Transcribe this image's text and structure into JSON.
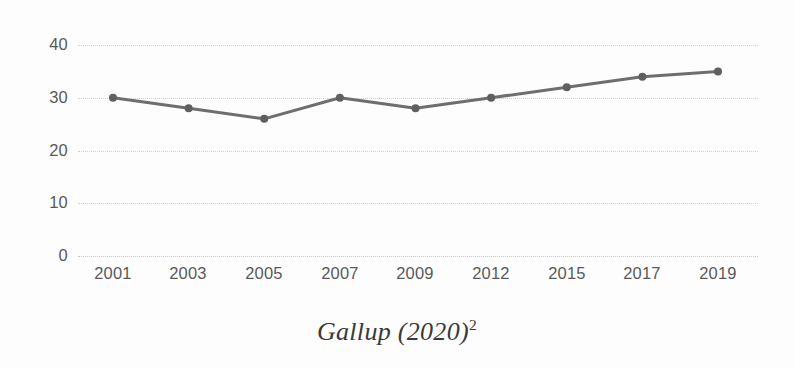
{
  "caption": {
    "text": "Gallup (2020)",
    "superscript": "2"
  },
  "colors": {
    "line": "#6e6e6e",
    "marker": "#5f5f5f",
    "grid": "#cfcfcf",
    "tick_text": "#5a5a5a",
    "background": "#fdfdfd",
    "caption_text": "#3a3a3a"
  },
  "chart_data": {
    "type": "line",
    "title": "",
    "subtitle": "",
    "xlabel": "",
    "ylabel": "",
    "categories": [
      "2001",
      "2003",
      "2005",
      "2007",
      "2009",
      "2012",
      "2015",
      "2017",
      "2019"
    ],
    "values": [
      30,
      28,
      26,
      30,
      28,
      30,
      32,
      34,
      35
    ],
    "series": [
      {
        "name": "Gallup",
        "values": [
          30,
          28,
          26,
          30,
          28,
          30,
          32,
          34,
          35
        ]
      }
    ],
    "ylim": [
      0,
      40
    ],
    "yticks": [
      0,
      10,
      20,
      30,
      40
    ],
    "ytick_labels": [
      "0",
      "10",
      "20",
      "30",
      "40"
    ],
    "xtick_labels": [
      "2001",
      "2003",
      "2005",
      "2007",
      "2009",
      "2012",
      "2015",
      "2017",
      "2019"
    ],
    "grid": "horizontal-dotted",
    "legend": "none",
    "markers": "filled-circle",
    "annotations": [
      "Gallup (2020)2"
    ]
  }
}
